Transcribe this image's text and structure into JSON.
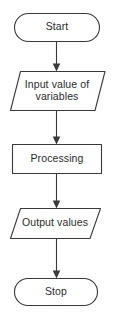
{
  "diagram": {
    "background_color": "#ffffff",
    "stroke_color": "#3a3a3a",
    "text_color": "#2b2b2b",
    "width": 114,
    "height": 318,
    "nodes": [
      {
        "id": "start",
        "shape": "terminator",
        "label": "Start"
      },
      {
        "id": "input",
        "shape": "parallelogram",
        "label": "Input value of\nvariables"
      },
      {
        "id": "processing",
        "shape": "rectangle",
        "label": "Processing"
      },
      {
        "id": "output",
        "shape": "parallelogram",
        "label": "Output values"
      },
      {
        "id": "stop",
        "shape": "terminator",
        "label": "Stop"
      }
    ],
    "connectors": [
      {
        "id": "start-to-input",
        "from": "start",
        "to": "input",
        "arrow": "down"
      },
      {
        "id": "input-to-processing",
        "from": "input",
        "to": "processing",
        "arrow": "down"
      },
      {
        "id": "processing-to-output",
        "from": "processing",
        "to": "output",
        "arrow": "down"
      },
      {
        "id": "output-to-stop",
        "from": "output",
        "to": "stop",
        "arrow": "down"
      }
    ]
  }
}
